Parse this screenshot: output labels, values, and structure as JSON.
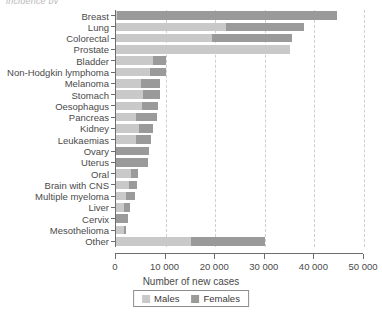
{
  "caption_fragment": "incidence by",
  "chart_data": {
    "type": "bar",
    "orientation": "horizontal",
    "stacked": true,
    "title": "",
    "xlabel": "Number of new cases",
    "ylabel": "",
    "xlim": [
      0,
      50000
    ],
    "xticks": [
      0,
      10000,
      20000,
      30000,
      40000,
      50000
    ],
    "xtick_labels": [
      "0",
      "10 000",
      "20 000",
      "30 000",
      "40 000",
      "50 000"
    ],
    "grid": "vertical-dashed",
    "legend_position": "bottom-center",
    "colors": {
      "males": "#c9c9c9",
      "females": "#9a9a9a",
      "axis": "#6d6d6d",
      "grid": "#cfcfcf"
    },
    "categories": [
      "Breast",
      "Lung",
      "Colorectal",
      "Prostate",
      "Bladder",
      "Non-Hodgkin lymphoma",
      "Melanoma",
      "Stomach",
      "Oesophagus",
      "Pancreas",
      "Kidney",
      "Leukaemias",
      "Ovary",
      "Uterus",
      "Oral",
      "Brain with CNS",
      "Multiple myeloma",
      "Liver",
      "Cervix",
      "Mesothelioma",
      "Other"
    ],
    "series": [
      {
        "name": "Males",
        "color": "#c9c9c9",
        "values": [
          300,
          22200,
          19400,
          35000,
          7500,
          6800,
          5000,
          5400,
          5200,
          4000,
          4600,
          4000,
          0,
          0,
          3000,
          2700,
          2100,
          1700,
          0,
          1600,
          15200
        ]
      },
      {
        "name": "Females",
        "color": "#9a9a9a",
        "values": [
          44300,
          15800,
          16000,
          0,
          2500,
          3200,
          3800,
          3500,
          3300,
          4300,
          2900,
          3000,
          6600,
          6500,
          1500,
          1600,
          1700,
          1100,
          2500,
          400,
          14900
        ]
      }
    ],
    "totals": [
      44600,
      38000,
      35400,
      35000,
      10000,
      10000,
      8800,
      8900,
      8500,
      8300,
      7500,
      7000,
      6600,
      6500,
      4500,
      4300,
      3800,
      2800,
      2500,
      2000,
      30100
    ]
  },
  "legend": {
    "items": [
      {
        "label": "Males",
        "color": "#c9c9c9"
      },
      {
        "label": "Females",
        "color": "#9a9a9a"
      }
    ]
  }
}
